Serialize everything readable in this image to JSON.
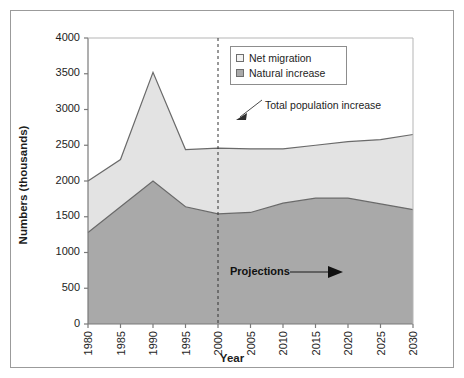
{
  "figure": {
    "width": 464,
    "height": 378,
    "background": "#ffffff",
    "frame_color": "#9b9b9b"
  },
  "colors": {
    "net_migration_fill": "#e0e0e0",
    "natural_increase_fill": "#a9a9a9",
    "line_color": "#5a5a5a",
    "axis_color": "#7a7a7a",
    "text_color": "#1d1d1d"
  },
  "legend": {
    "position": "top-right-inside",
    "items": [
      {
        "label": "Net migration",
        "swatch": "#f0f0f0"
      },
      {
        "label": "Natural increase",
        "swatch": "#a9a9a9"
      }
    ]
  },
  "annotations": {
    "total_population": "Total population increase",
    "projections": "Projections",
    "projection_divider_year": 2000
  },
  "axes": {
    "ylabel": "Numbers (thousands)",
    "xlabel": "Year",
    "ylim": [
      0,
      4000
    ],
    "yticks": [
      0,
      500,
      1000,
      1500,
      2000,
      2500,
      3000,
      3500,
      4000
    ],
    "ytick_labels": [
      "0",
      "500",
      "1000",
      "1500",
      "2000",
      "2500",
      "3000",
      "3500",
      "4000"
    ],
    "xticks": [
      1980,
      1985,
      1990,
      1995,
      2000,
      2005,
      2010,
      2015,
      2020,
      2025,
      2030
    ],
    "xtick_labels": [
      "1980",
      "1985",
      "1990",
      "1995",
      "2000",
      "2005",
      "2010",
      "2015",
      "2020",
      "2025",
      "2030"
    ],
    "grid": false
  },
  "chart_data": {
    "type": "area",
    "title": "",
    "subtitle": "",
    "xlabel": "Year",
    "ylabel": "Numbers (thousands)",
    "ylim": [
      0,
      4000
    ],
    "xlim": [
      1980,
      2030
    ],
    "grid": false,
    "legend_position": "top-right",
    "stacked": true,
    "categories": [
      1980,
      1985,
      1990,
      1995,
      2000,
      2005,
      2010,
      2015,
      2020,
      2025,
      2030
    ],
    "series": [
      {
        "name": "Natural increase",
        "values": [
          1280,
          1640,
          2000,
          1640,
          1540,
          1560,
          1690,
          1760,
          1760,
          1680,
          1600
        ]
      },
      {
        "name": "Net migration",
        "values": [
          720,
          660,
          1520,
          800,
          920,
          890,
          760,
          740,
          790,
          900,
          1050
        ]
      }
    ],
    "total_series": {
      "name": "Total population increase",
      "values": [
        2000,
        2300,
        3520,
        2440,
        2460,
        2450,
        2450,
        2500,
        2550,
        2580,
        2650
      ]
    },
    "annotations": [
      {
        "text": "Total population increase",
        "type": "arrow-label",
        "points_to_year": 2000
      },
      {
        "text": "Projections",
        "type": "arrow-label",
        "region_start_year": 2000
      }
    ]
  }
}
